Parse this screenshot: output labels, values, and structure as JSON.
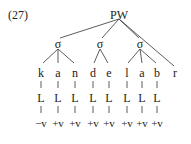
{
  "example_number": "(27)",
  "root": {
    "label": "PW",
    "x": 119
  },
  "syllables": [
    {
      "label": "σ",
      "x": 58
    },
    {
      "label": "σ",
      "x": 100
    },
    {
      "label": "σ",
      "x": 140
    }
  ],
  "segments": [
    {
      "label": "k",
      "x": 41,
      "L": "L",
      "feature": "−v"
    },
    {
      "label": "a",
      "x": 58,
      "L": "L",
      "feature": "+v"
    },
    {
      "label": "n",
      "x": 75,
      "L": "L",
      "feature": "+v"
    },
    {
      "label": "d",
      "x": 93,
      "L": "L",
      "feature": "+v"
    },
    {
      "label": "e",
      "x": 109,
      "L": "L",
      "feature": "+v"
    },
    {
      "label": "l",
      "x": 127,
      "L": "L",
      "feature": "+v"
    },
    {
      "label": "a",
      "x": 142,
      "L": "L",
      "feature": "+v"
    },
    {
      "label": "b",
      "x": 157,
      "L": "L",
      "feature": "+v"
    },
    {
      "label": "r",
      "x": 175,
      "L": null,
      "feature": null
    }
  ]
}
